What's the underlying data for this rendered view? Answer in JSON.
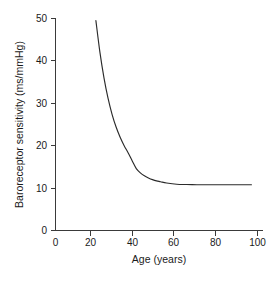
{
  "chart_data": {
    "type": "line",
    "title": "",
    "subtitle": "",
    "xlabel": "Age (years)",
    "ylabel": "Baroreceptor sensitivity (ms/mmHg)",
    "xlim": [
      0,
      100
    ],
    "ylim": [
      0,
      50
    ],
    "xticks": [
      0,
      20,
      40,
      60,
      80,
      100
    ],
    "yticks": [
      0,
      10,
      20,
      30,
      40,
      50
    ],
    "xtick_labels": [
      "0",
      "20",
      "40",
      "60",
      "80",
      "100"
    ],
    "ytick_labels": [
      "0",
      "10",
      "20",
      "30",
      "40",
      "50"
    ],
    "grid": false,
    "legend": null,
    "legend_position": "none",
    "annotations": [],
    "line_color": "#2b2b2b",
    "series": [
      {
        "name": "Baroreceptor sensitivity",
        "x": [
          20,
          22,
          24,
          26,
          28,
          30,
          32,
          34,
          36,
          38,
          40,
          42,
          44,
          46,
          48,
          50,
          52,
          55,
          60,
          65,
          70,
          75,
          80,
          85,
          90,
          97
        ],
        "y": [
          49.5,
          42.0,
          36.0,
          31.2,
          27.4,
          24.4,
          22.0,
          20.0,
          18.3,
          16.4,
          14.6,
          13.6,
          12.9,
          12.4,
          12.0,
          11.7,
          11.5,
          11.2,
          10.9,
          10.85,
          10.8,
          10.8,
          10.8,
          10.8,
          10.8,
          10.8
        ]
      }
    ]
  },
  "axes": {
    "x_title": "Age (years)",
    "y_title": "Baroreceptor sensitivity (ms/mmHg)"
  }
}
